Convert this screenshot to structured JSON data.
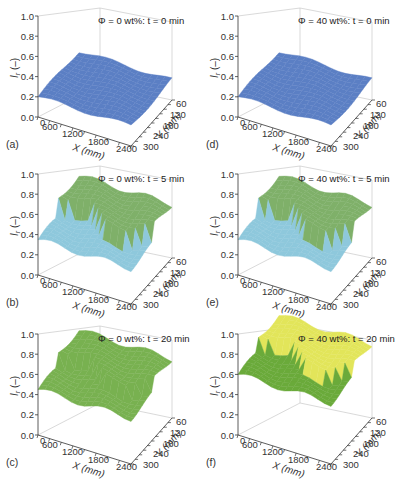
{
  "chart_data": [
    {
      "type": "surface3d",
      "panel": "(a)",
      "annotation": "Φ = 0 wt%: t = 0 min",
      "phi_wt_pct": 0,
      "t_min": 0,
      "xlabel": "X (mm)",
      "ylabel": "Y (mm)",
      "zlabel": "Ir (–)",
      "x_ticks": [
        "0",
        "600",
        "1200",
        "1800",
        "2400"
      ],
      "y_ticks": [
        "60",
        "120",
        "180",
        "240",
        "300"
      ],
      "z_ticks": [
        "0.0",
        "0.2",
        "0.4",
        "0.6",
        "0.8",
        "1.0"
      ],
      "zlim": [
        0,
        1
      ],
      "surface_level_approx": 0.2,
      "colors": {
        "low": "#5b7fc4"
      }
    },
    {
      "type": "surface3d",
      "panel": "(b)",
      "annotation": "Φ = 0 wt%: t = 5 min",
      "phi_wt_pct": 0,
      "t_min": 5,
      "xlabel": "X (mm)",
      "ylabel": "Y (mm)",
      "zlabel": "Ir (–)",
      "x_ticks": [
        "0",
        "600",
        "1200",
        "1800",
        "2400"
      ],
      "y_ticks": [
        "60",
        "120",
        "180",
        "240",
        "300"
      ],
      "z_ticks": [
        "0.0",
        "0.2",
        "0.4",
        "0.6",
        "0.8",
        "1.0"
      ],
      "zlim": [
        0,
        1
      ],
      "surface_level_approx": [
        0.35,
        0.55
      ],
      "colors": {
        "low": "#8ec8dc",
        "high": "#7fb069"
      }
    },
    {
      "type": "surface3d",
      "panel": "(c)",
      "annotation": "Φ = 0 wt%: t = 20 min",
      "phi_wt_pct": 0,
      "t_min": 20,
      "xlabel": "X (mm)",
      "ylabel": "Y (mm)",
      "zlabel": "Ir (–)",
      "x_ticks": [
        "0",
        "600",
        "1200",
        "1800",
        "2400"
      ],
      "y_ticks": [
        "60",
        "120",
        "180",
        "240",
        "300"
      ],
      "z_ticks": [
        "0.0",
        "0.2",
        "0.4",
        "0.6",
        "0.8",
        "1.0"
      ],
      "zlim": [
        0,
        1
      ],
      "surface_level_approx": [
        0.45,
        0.6
      ],
      "colors": {
        "high": "#78b150"
      }
    },
    {
      "type": "surface3d",
      "panel": "(d)",
      "annotation": "Φ = 40 wt%: t = 0 min",
      "phi_wt_pct": 40,
      "t_min": 0,
      "xlabel": "X (mm)",
      "ylabel": "Y (mm)",
      "zlabel": "Ir (–)",
      "x_ticks": [
        "0",
        "600",
        "1200",
        "1800",
        "2400"
      ],
      "y_ticks": [
        "60",
        "120",
        "180",
        "240",
        "300"
      ],
      "z_ticks": [
        "0.0",
        "0.2",
        "0.4",
        "0.6",
        "0.8",
        "1.0"
      ],
      "zlim": [
        0,
        1
      ],
      "surface_level_approx": 0.2,
      "colors": {
        "low": "#5b7fc4"
      }
    },
    {
      "type": "surface3d",
      "panel": "(e)",
      "annotation": "Φ = 40 wt%: t = 5 min",
      "phi_wt_pct": 40,
      "t_min": 5,
      "xlabel": "X (mm)",
      "ylabel": "Y (mm)",
      "zlabel": "Ir (–)",
      "x_ticks": [
        "0",
        "600",
        "1200",
        "1800",
        "2400"
      ],
      "y_ticks": [
        "60",
        "120",
        "180",
        "240",
        "300"
      ],
      "z_ticks": [
        "0.0",
        "0.2",
        "0.4",
        "0.6",
        "0.8",
        "1.0"
      ],
      "zlim": [
        0,
        1
      ],
      "surface_level_approx": [
        0.35,
        0.55
      ],
      "colors": {
        "low": "#8ec8dc",
        "high": "#7fb069"
      }
    },
    {
      "type": "surface3d",
      "panel": "(f)",
      "annotation": "Φ = 40 wt%: t = 20 min",
      "phi_wt_pct": 40,
      "t_min": 20,
      "xlabel": "X (mm)",
      "ylabel": "Y (mm)",
      "zlabel": "Ir (–)",
      "x_ticks": [
        "0",
        "600",
        "1200",
        "1800",
        "2400"
      ],
      "y_ticks": [
        "60",
        "120",
        "180",
        "240",
        "300"
      ],
      "z_ticks": [
        "0.0",
        "0.2",
        "0.4",
        "0.6",
        "0.8",
        "1.0"
      ],
      "zlim": [
        0,
        1
      ],
      "surface_level_approx": [
        0.6,
        0.75
      ],
      "colors": {
        "low": "#6aaa3a",
        "high": "#e2e55a"
      }
    }
  ],
  "panels": [
    {
      "label": "(a)",
      "ann": "Φ = 0 wt%: t = 0 min"
    },
    {
      "label": "(b)",
      "ann": "Φ = 0 wt%: t = 5 min"
    },
    {
      "label": "(c)",
      "ann": "Φ = 0 wt%: t = 20 min"
    },
    {
      "label": "(d)",
      "ann": "Φ = 40 wt%: t = 0 min"
    },
    {
      "label": "(e)",
      "ann": "Φ = 40 wt%: t = 5 min"
    },
    {
      "label": "(f)",
      "ann": "Φ = 40 wt%: t = 20 min"
    }
  ],
  "axes": {
    "z_ticks": [
      "1.0",
      "0.8",
      "0.6",
      "0.4",
      "0.2",
      "0.0"
    ],
    "x_ticks": [
      "0",
      "600",
      "1200",
      "1800",
      "2400"
    ],
    "y_ticks": [
      "60",
      "120",
      "180",
      "240",
      "300"
    ],
    "xlabel": "X (mm)",
    "ylabel": "Y (mm)",
    "zlabel": "I",
    "zlabel_sub": "r",
    "zlabel_unit": "(–)"
  }
}
